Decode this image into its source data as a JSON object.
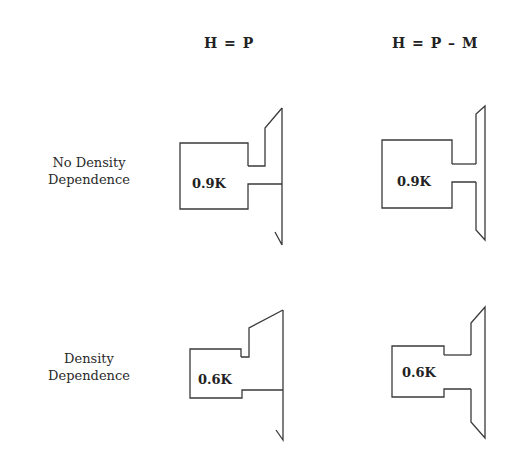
{
  "columns": [
    {
      "label": "H = P"
    },
    {
      "label": "H = P – M"
    }
  ],
  "rows": [
    {
      "label_line1": "No Density",
      "label_line2": "Dependence"
    },
    {
      "label_line1": "Density",
      "label_line2": "Dependence"
    }
  ],
  "cells": [
    {
      "row": 0,
      "col": 0,
      "value": "0.9K",
      "shape": "box-with-neck-and-vertical-line"
    },
    {
      "row": 0,
      "col": 1,
      "value": "0.9K",
      "shape": "box-with-neck-and-trapezoid"
    },
    {
      "row": 1,
      "col": 0,
      "value": "0.6K",
      "shape": "box-with-neck-and-vertical-line"
    },
    {
      "row": 1,
      "col": 1,
      "value": "0.6K",
      "shape": "box-with-neck-and-trapezoid"
    }
  ],
  "colors": {
    "stroke": "#3a3a3a",
    "text": "#222222",
    "background": "#ffffff"
  }
}
